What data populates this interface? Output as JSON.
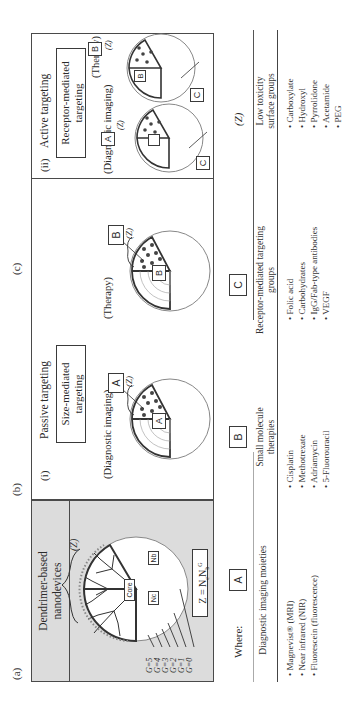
{
  "figure": {
    "panel_labels": {
      "a": "(a)",
      "b": "(b)",
      "c": "(c)"
    },
    "panel_a": {
      "title": [
        "Dendrimer-based",
        "nanodevices"
      ],
      "generations": [
        "G=5",
        "G=4",
        "G=3",
        "G=2",
        "G=1",
        "G=0"
      ],
      "core_label": "Core",
      "nc_label": "Nc",
      "nb_label": "Nb",
      "surface_label": "(Z)",
      "equation": "Z = Nc Nb^G",
      "equation_parts": {
        "lhs": "Z = N",
        "c": "c",
        "mid": "N",
        "b": "b",
        "sup": "G"
      }
    },
    "panel_b": {
      "numeral": "(i)",
      "heading": "Passive targeting",
      "boxed_text": [
        "Size-mediated",
        "targeting"
      ],
      "diagrams": [
        {
          "caption": "(Diagnostic imaging)",
          "outer_label": "A",
          "inner_label": "A",
          "surface_label": "(Z)"
        },
        {
          "caption": "(Therapy)",
          "outer_label": "B",
          "inner_label": "B",
          "surface_label": "(Z)"
        }
      ]
    },
    "panel_c": {
      "numeral": "(ii)",
      "heading": "Active targeting",
      "boxed_text": [
        "Receptor-mediated",
        "targeting"
      ],
      "diagrams": [
        {
          "caption": "(Diagnostic imaging)",
          "outer_label": "A",
          "inner_label": "",
          "surface_label": "(Z)",
          "ligand_label": "C"
        },
        {
          "caption": "(Therapy)",
          "outer_label": "B",
          "inner_label": "B",
          "surface_label": "(Z)",
          "ligand_label": "C"
        }
      ]
    },
    "legend": {
      "where_label": "Where:",
      "columns": [
        {
          "key": "A",
          "header": [
            "Diagnostic imaging moieties"
          ],
          "items": [
            "Magnevist® (MRI)",
            "Near infrared (NIR)",
            "Fluorescein (fluorescence)"
          ]
        },
        {
          "key": "B",
          "header": [
            "Small molecule",
            "therapies"
          ],
          "items": [
            "Cisplatin",
            "Methotrexate",
            "Adriamycin",
            "5-Fluorouracil"
          ]
        },
        {
          "key": "C",
          "header": [
            "Receptor-mediated targeting",
            "groups"
          ],
          "items": [
            "Folic acid",
            "Carbohydrates",
            "IgG/Fab-type antibodies",
            "VEGF"
          ]
        },
        {
          "key": "(Z)",
          "header": [
            "Low toxicity",
            "surface groups"
          ],
          "items": [
            "Carboxylate",
            "Hydroxyl",
            "Pyrrolidone",
            "Acetamide",
            "PEG"
          ]
        }
      ]
    }
  },
  "colors": {
    "panel_a_fill": "#dcdcdc",
    "line": "#4a4a4a",
    "text": "#2a2a2a"
  }
}
